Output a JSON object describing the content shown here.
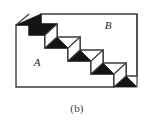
{
  "figure": {
    "caption": "(b)",
    "caption_name": "figure-caption-b",
    "type": "isometric-staircase-diagram",
    "labels": [
      {
        "text": "A",
        "region": "lower-left",
        "x": 37,
        "y": 66
      },
      {
        "text": "B",
        "region": "upper-right",
        "x": 108,
        "y": 29
      }
    ],
    "colors": {
      "outline": "#3d3d3d",
      "shadow_fill": "#141414",
      "face_fill": "#ffffff",
      "background": "#ffffff",
      "label_color": "#1a1a1a",
      "caption_color": "#3a3a3a"
    },
    "geometry": {
      "outer_left": 15,
      "outer_right": 138,
      "outer_top": 15,
      "outer_bottom": 88,
      "step_count": 4,
      "step_run": 23,
      "step_rise": 13,
      "depth_dx": 12,
      "depth_dy": -11
    }
  }
}
